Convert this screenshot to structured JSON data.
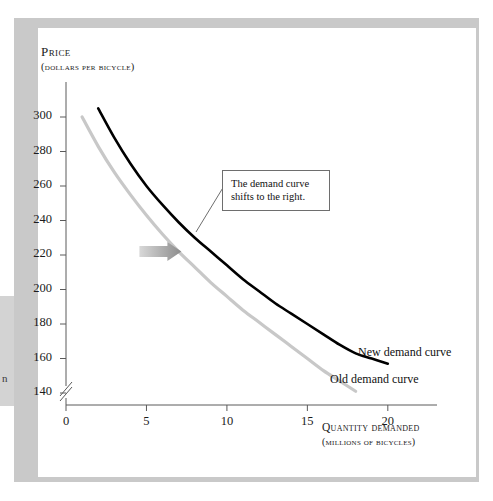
{
  "figure": {
    "background_color": "#ffffff",
    "frame_color": "#c9c9c9",
    "bleed_glyph": "n"
  },
  "chart_data": {
    "type": "line",
    "title": "",
    "xlabel": "Quantity demanded",
    "xlabel_sub": "(millions of bicycles)",
    "ylabel": "Price",
    "ylabel_sub": "(dollars per bicycle)",
    "xlim": [
      0,
      22
    ],
    "ylim": [
      130,
      310
    ],
    "y_axis_break": true,
    "y_axis_break_below": 140,
    "grid": false,
    "legend_position": "inline-right",
    "xticks": [
      0,
      5,
      10,
      15,
      20
    ],
    "xtick_labels": [
      "0",
      "5",
      "10",
      "15",
      "20"
    ],
    "yticks": [
      140,
      160,
      180,
      200,
      220,
      240,
      260,
      280,
      300
    ],
    "ytick_labels": [
      "140",
      "160",
      "180",
      "200",
      "220",
      "240",
      "260",
      "280",
      "300"
    ],
    "series": [
      {
        "name": "Old demand curve",
        "color": "#c8c8c8",
        "label": "Old demand curve",
        "x": [
          1.0,
          2.0,
          3.0,
          4.0,
          5.0,
          6.0,
          7.0,
          8.0,
          9.0,
          10.0,
          11.0,
          12.0,
          13.0,
          14.0,
          15.0,
          16.0,
          17.0,
          18.0
        ],
        "y": [
          300,
          283,
          268,
          255,
          243,
          232,
          222,
          213,
          204,
          196,
          188,
          181,
          174,
          167,
          160,
          153,
          147,
          141
        ]
      },
      {
        "name": "New demand curve",
        "color": "#000000",
        "label": "New demand curve",
        "x": [
          2.0,
          3.0,
          4.0,
          5.0,
          6.0,
          7.0,
          8.0,
          9.0,
          10.0,
          11.0,
          12.0,
          13.0,
          14.0,
          15.0,
          16.0,
          17.0,
          18.0,
          19.0,
          20.0
        ],
        "y": [
          305,
          288,
          273,
          260,
          249,
          239,
          230,
          222,
          214,
          206,
          199,
          192,
          186,
          180,
          174,
          168,
          163,
          160,
          157
        ]
      }
    ],
    "annotations": [
      {
        "name": "shift-callout",
        "lines": [
          "The demand curve",
          "shifts to the right."
        ],
        "box": true,
        "leader_to": [
          7.2,
          222
        ]
      },
      {
        "name": "shift-arrow",
        "kind": "block-arrow",
        "direction": "right",
        "color": "#9e9e9e",
        "at": [
          6.3,
          222
        ]
      }
    ]
  }
}
